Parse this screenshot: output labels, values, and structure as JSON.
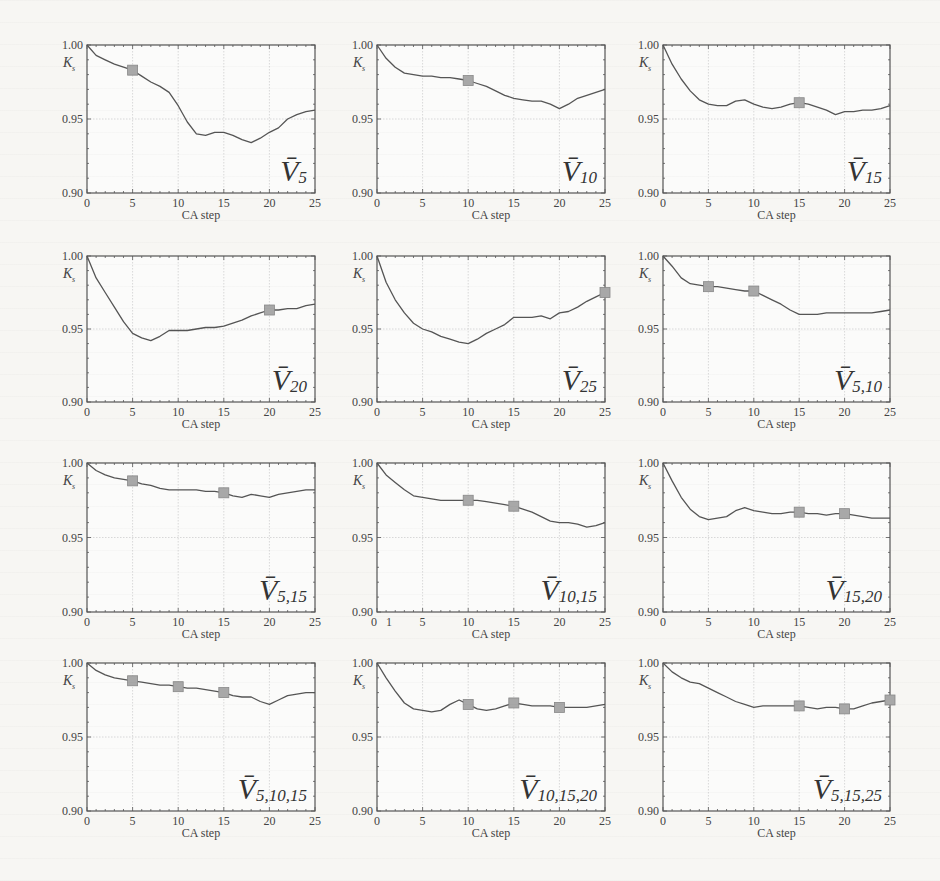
{
  "figure": {
    "layout": {
      "rows": 4,
      "cols": 3
    },
    "shared": {
      "xlabel": "CA step",
      "ylabel": "K",
      "ylabel_sub": "s",
      "xlim": [
        0,
        25
      ],
      "ylim": [
        0.9,
        1.0
      ],
      "xticks": [
        "0",
        "5",
        "10",
        "15",
        "20",
        "25"
      ],
      "yticks": [
        "0.90",
        "0.95",
        "1.00"
      ],
      "line_color": "#555555",
      "marker_color": "#a8a8a8",
      "grid_color": "#cfcfcf"
    }
  },
  "chart_data": [
    {
      "type": "line",
      "title": "V̄5",
      "label_main": "V",
      "label_sub": "5",
      "xlabel": "CA step",
      "ylabel": "Ks",
      "xlim": [
        0,
        25
      ],
      "ylim": [
        0.9,
        1.0
      ],
      "grid": true,
      "x": [
        0,
        1,
        2,
        3,
        4,
        5,
        6,
        7,
        8,
        9,
        10,
        11,
        12,
        13,
        14,
        15,
        16,
        17,
        18,
        19,
        20,
        21,
        22,
        23,
        24,
        25
      ],
      "values": [
        1.0,
        0.993,
        0.99,
        0.987,
        0.985,
        0.983,
        0.979,
        0.975,
        0.972,
        0.968,
        0.959,
        0.948,
        0.94,
        0.939,
        0.941,
        0.941,
        0.939,
        0.936,
        0.934,
        0.937,
        0.941,
        0.944,
        0.95,
        0.953,
        0.955,
        0.956
      ],
      "markers": [
        5
      ]
    },
    {
      "type": "line",
      "title": "V̄10",
      "label_main": "V",
      "label_sub": "10",
      "xlabel": "CA step",
      "ylabel": "Ks",
      "xlim": [
        0,
        25
      ],
      "ylim": [
        0.9,
        1.0
      ],
      "grid": true,
      "x": [
        0,
        1,
        2,
        3,
        4,
        5,
        6,
        7,
        8,
        9,
        10,
        11,
        12,
        13,
        14,
        15,
        16,
        17,
        18,
        19,
        20,
        21,
        22,
        23,
        24,
        25
      ],
      "values": [
        1.0,
        0.991,
        0.985,
        0.981,
        0.98,
        0.979,
        0.979,
        0.978,
        0.978,
        0.977,
        0.976,
        0.974,
        0.972,
        0.969,
        0.966,
        0.964,
        0.963,
        0.962,
        0.962,
        0.96,
        0.957,
        0.96,
        0.964,
        0.966,
        0.968,
        0.97
      ],
      "markers": [
        10
      ]
    },
    {
      "type": "line",
      "title": "V̄15",
      "label_main": "V",
      "label_sub": "15",
      "xlabel": "CA step",
      "ylabel": "Ks",
      "xlim": [
        0,
        25
      ],
      "ylim": [
        0.9,
        1.0
      ],
      "grid": true,
      "x": [
        0,
        1,
        2,
        3,
        4,
        5,
        6,
        7,
        8,
        9,
        10,
        11,
        12,
        13,
        14,
        15,
        16,
        17,
        18,
        19,
        20,
        21,
        22,
        23,
        24,
        25
      ],
      "values": [
        1.0,
        0.987,
        0.977,
        0.969,
        0.963,
        0.96,
        0.959,
        0.959,
        0.962,
        0.963,
        0.96,
        0.958,
        0.957,
        0.958,
        0.96,
        0.961,
        0.96,
        0.958,
        0.956,
        0.953,
        0.955,
        0.955,
        0.956,
        0.956,
        0.957,
        0.959
      ],
      "markers": [
        15
      ]
    },
    {
      "type": "line",
      "title": "V̄20",
      "label_main": "V",
      "label_sub": "20",
      "xlabel": "CA step",
      "ylabel": "Ks",
      "xlim": [
        0,
        25
      ],
      "ylim": [
        0.9,
        1.0
      ],
      "grid": true,
      "x": [
        0,
        1,
        2,
        3,
        4,
        5,
        6,
        7,
        8,
        9,
        10,
        11,
        12,
        13,
        14,
        15,
        16,
        17,
        18,
        19,
        20,
        21,
        22,
        23,
        24,
        25
      ],
      "values": [
        1.0,
        0.985,
        0.975,
        0.965,
        0.955,
        0.947,
        0.944,
        0.942,
        0.945,
        0.949,
        0.949,
        0.949,
        0.95,
        0.951,
        0.951,
        0.952,
        0.954,
        0.956,
        0.959,
        0.961,
        0.963,
        0.963,
        0.964,
        0.964,
        0.966,
        0.967
      ],
      "markers": [
        20
      ]
    },
    {
      "type": "line",
      "title": "V̄25",
      "label_main": "V",
      "label_sub": "25",
      "xlabel": "CA step",
      "ylabel": "Ks",
      "xlim": [
        0,
        25
      ],
      "ylim": [
        0.9,
        1.0
      ],
      "grid": true,
      "x": [
        0,
        1,
        2,
        3,
        4,
        5,
        6,
        7,
        8,
        9,
        10,
        11,
        12,
        13,
        14,
        15,
        16,
        17,
        18,
        19,
        20,
        21,
        22,
        23,
        24,
        25
      ],
      "values": [
        1.0,
        0.982,
        0.97,
        0.961,
        0.954,
        0.95,
        0.948,
        0.945,
        0.943,
        0.941,
        0.94,
        0.943,
        0.947,
        0.95,
        0.953,
        0.958,
        0.958,
        0.958,
        0.959,
        0.957,
        0.961,
        0.962,
        0.965,
        0.969,
        0.972,
        0.975
      ],
      "markers": [
        25
      ]
    },
    {
      "type": "line",
      "title": "V̄5,10",
      "label_main": "V",
      "label_sub": "5,10",
      "xlabel": "CA step",
      "ylabel": "Ks",
      "xlim": [
        0,
        25
      ],
      "ylim": [
        0.9,
        1.0
      ],
      "grid": true,
      "x": [
        0,
        1,
        2,
        3,
        4,
        5,
        6,
        7,
        8,
        9,
        10,
        11,
        12,
        13,
        14,
        15,
        16,
        17,
        18,
        19,
        20,
        21,
        22,
        23,
        24,
        25
      ],
      "values": [
        1.0,
        0.993,
        0.985,
        0.981,
        0.98,
        0.979,
        0.979,
        0.978,
        0.977,
        0.976,
        0.976,
        0.973,
        0.97,
        0.967,
        0.963,
        0.96,
        0.96,
        0.96,
        0.961,
        0.961,
        0.961,
        0.961,
        0.961,
        0.961,
        0.962,
        0.963
      ],
      "markers": [
        5,
        10
      ]
    },
    {
      "type": "line",
      "title": "V̄5,15",
      "label_main": "V",
      "label_sub": "5,15",
      "xlabel": "CA step",
      "ylabel": "Ks",
      "xlim": [
        0,
        25
      ],
      "ylim": [
        0.9,
        1.0
      ],
      "grid": true,
      "x": [
        0,
        1,
        2,
        3,
        4,
        5,
        6,
        7,
        8,
        9,
        10,
        11,
        12,
        13,
        14,
        15,
        16,
        17,
        18,
        19,
        20,
        21,
        22,
        23,
        24,
        25
      ],
      "values": [
        1.0,
        0.995,
        0.992,
        0.99,
        0.989,
        0.988,
        0.986,
        0.985,
        0.983,
        0.982,
        0.982,
        0.982,
        0.982,
        0.981,
        0.981,
        0.98,
        0.978,
        0.977,
        0.979,
        0.978,
        0.977,
        0.979,
        0.98,
        0.981,
        0.982,
        0.982
      ],
      "markers": [
        5,
        15
      ]
    },
    {
      "type": "line",
      "title": "V̄10,15",
      "label_main": "V",
      "label_sub": "10,15",
      "xlabel": "CA step",
      "ylabel": "Ks",
      "xlim": [
        0,
        25
      ],
      "ylim": [
        0.9,
        1.0
      ],
      "grid": true,
      "xticks_override": [
        "0",
        "1",
        "5",
        "10",
        "15",
        "20",
        "25"
      ],
      "x": [
        0,
        1,
        2,
        3,
        4,
        5,
        6,
        7,
        8,
        9,
        10,
        11,
        12,
        13,
        14,
        15,
        16,
        17,
        18,
        19,
        20,
        21,
        22,
        23,
        24,
        25
      ],
      "values": [
        1.0,
        0.992,
        0.987,
        0.982,
        0.978,
        0.977,
        0.976,
        0.975,
        0.975,
        0.975,
        0.975,
        0.975,
        0.974,
        0.973,
        0.972,
        0.971,
        0.969,
        0.967,
        0.964,
        0.961,
        0.96,
        0.96,
        0.959,
        0.957,
        0.958,
        0.96
      ],
      "markers": [
        10,
        15
      ]
    },
    {
      "type": "line",
      "title": "V̄15,20",
      "label_main": "V",
      "label_sub": "15,20",
      "xlabel": "CA step",
      "ylabel": "Ks",
      "xlim": [
        0,
        25
      ],
      "ylim": [
        0.9,
        1.0
      ],
      "grid": true,
      "x": [
        0,
        1,
        2,
        3,
        4,
        5,
        6,
        7,
        8,
        9,
        10,
        11,
        12,
        13,
        14,
        15,
        16,
        17,
        18,
        19,
        20,
        21,
        22,
        23,
        24,
        25
      ],
      "values": [
        1.0,
        0.988,
        0.977,
        0.969,
        0.964,
        0.962,
        0.963,
        0.964,
        0.968,
        0.97,
        0.968,
        0.967,
        0.966,
        0.966,
        0.967,
        0.967,
        0.966,
        0.966,
        0.965,
        0.966,
        0.966,
        0.965,
        0.964,
        0.963,
        0.963,
        0.963
      ],
      "markers": [
        15,
        20
      ]
    },
    {
      "type": "line",
      "title": "V̄5,10,15",
      "label_main": "V",
      "label_sub": "5,10,15",
      "xlabel": "CA step",
      "ylabel": "Ks",
      "xlim": [
        0,
        25
      ],
      "ylim": [
        0.9,
        1.0
      ],
      "grid": true,
      "x": [
        0,
        1,
        2,
        3,
        4,
        5,
        6,
        7,
        8,
        9,
        10,
        11,
        12,
        13,
        14,
        15,
        16,
        17,
        18,
        19,
        20,
        21,
        22,
        23,
        24,
        25
      ],
      "values": [
        1.0,
        0.995,
        0.992,
        0.99,
        0.989,
        0.988,
        0.987,
        0.986,
        0.985,
        0.985,
        0.984,
        0.983,
        0.983,
        0.982,
        0.981,
        0.98,
        0.978,
        0.977,
        0.977,
        0.974,
        0.972,
        0.975,
        0.978,
        0.979,
        0.98,
        0.98
      ],
      "markers": [
        5,
        10,
        15
      ]
    },
    {
      "type": "line",
      "title": "V̄10,15,20",
      "label_main": "V",
      "label_sub": "10,15,20",
      "xlabel": "CA step",
      "ylabel": "Ks",
      "xlim": [
        0,
        25
      ],
      "ylim": [
        0.9,
        1.0
      ],
      "grid": true,
      "x": [
        0,
        1,
        2,
        3,
        4,
        5,
        6,
        7,
        8,
        9,
        10,
        11,
        12,
        13,
        14,
        15,
        16,
        17,
        18,
        19,
        20,
        21,
        22,
        23,
        24,
        25
      ],
      "values": [
        1.0,
        0.99,
        0.981,
        0.973,
        0.969,
        0.968,
        0.967,
        0.968,
        0.972,
        0.975,
        0.972,
        0.969,
        0.968,
        0.969,
        0.971,
        0.973,
        0.972,
        0.971,
        0.971,
        0.971,
        0.97,
        0.97,
        0.97,
        0.97,
        0.971,
        0.972
      ],
      "markers": [
        10,
        15,
        20
      ]
    },
    {
      "type": "line",
      "title": "V̄5,15,25",
      "label_main": "V",
      "label_sub": "5,15,25",
      "xlabel": "CA step",
      "ylabel": "Ks",
      "xlim": [
        0,
        25
      ],
      "ylim": [
        0.9,
        1.0
      ],
      "grid": true,
      "x": [
        0,
        1,
        2,
        3,
        4,
        5,
        6,
        7,
        8,
        9,
        10,
        11,
        12,
        13,
        14,
        15,
        16,
        17,
        18,
        19,
        20,
        21,
        22,
        23,
        24,
        25
      ],
      "values": [
        1.0,
        0.994,
        0.99,
        0.987,
        0.986,
        0.983,
        0.98,
        0.977,
        0.974,
        0.972,
        0.97,
        0.971,
        0.971,
        0.971,
        0.971,
        0.971,
        0.97,
        0.969,
        0.97,
        0.97,
        0.969,
        0.969,
        0.971,
        0.973,
        0.974,
        0.975
      ],
      "markers": [
        15,
        20,
        25
      ]
    }
  ]
}
